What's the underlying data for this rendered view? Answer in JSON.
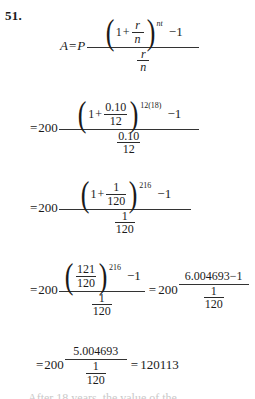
{
  "page": {
    "problem_number": "51.",
    "background_color": "#ffffff",
    "text_color": "#1a1a1a"
  },
  "symbols": {
    "equals": "=",
    "plus": "+",
    "minus_one": "−1",
    "one": "1",
    "paren_left": "(",
    "paren_right": ")"
  },
  "steps": [
    {
      "id": "step-1",
      "lhs": "A",
      "equals": "=",
      "coefficient": "P",
      "coefficient_italic": true,
      "numerator": {
        "base_left": "1",
        "base_fraction": {
          "numerator": "r",
          "denominator": "n",
          "italic": true
        },
        "exponent": "nt",
        "exponent_italic": true,
        "trailing": "−1"
      },
      "denominator": {
        "numerator": "r",
        "denominator": "n",
        "italic": true
      }
    },
    {
      "id": "step-2",
      "lhs": "",
      "equals": "=",
      "coefficient": "200",
      "coefficient_italic": false,
      "numerator": {
        "base_left": "1",
        "base_fraction": {
          "numerator": "0.10",
          "denominator": "12",
          "italic": false
        },
        "exponent": "12(18)",
        "exponent_italic": false,
        "trailing": "−1"
      },
      "denominator": {
        "numerator": "0.10",
        "denominator": "12",
        "italic": false
      }
    },
    {
      "id": "step-3",
      "lhs": "",
      "equals": "=",
      "coefficient": "200",
      "coefficient_italic": false,
      "numerator": {
        "base_left": "1",
        "base_fraction": {
          "numerator": "1",
          "denominator": "120",
          "italic": false
        },
        "exponent": "216",
        "exponent_italic": false,
        "trailing": "−1"
      },
      "denominator": {
        "numerator": "1",
        "denominator": "120",
        "italic": false
      }
    },
    {
      "id": "step-4",
      "lhs": "",
      "equals": "=",
      "coefficient": "200",
      "coefficient_italic": false,
      "numerator": {
        "base_left": "",
        "base_fraction": {
          "numerator": "121",
          "denominator": "120",
          "italic": false
        },
        "exponent": "216",
        "exponent_italic": false,
        "trailing": "−1"
      },
      "denominator": {
        "numerator": "1",
        "denominator": "120",
        "italic": false
      },
      "second_equals": "=",
      "second_coefficient": "200",
      "second_numerator": "6.004693−1",
      "second_denominator": {
        "numerator": "1",
        "denominator": "120"
      }
    },
    {
      "id": "step-5",
      "lhs": "",
      "equals": "=",
      "coefficient": "200",
      "coefficient_italic": false,
      "numerator_plain": "5.004693",
      "denominator": {
        "numerator": "1",
        "denominator": "120"
      },
      "result_equals": "=",
      "result": "120113"
    }
  ],
  "cutoff_text": "After 18 years, the value of the"
}
